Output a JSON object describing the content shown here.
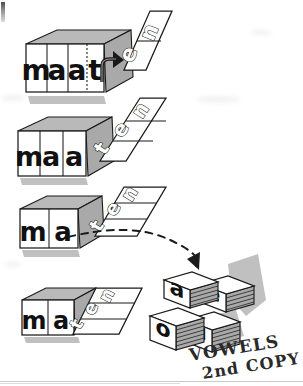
{
  "figure": {
    "background_color": "#ffffff",
    "ink_color": "#1a1a1a",
    "tile_face_color": "#ffffff",
    "tile_shadow_color": "#9b9b9b",
    "tile_side_color": "#a8a8a8",
    "page_rule_color": "#b9b9b9"
  },
  "rows": [
    {
      "id": "row-1",
      "front_word": "maat",
      "front_letters": [
        "m",
        "a",
        "a",
        "t"
      ],
      "folded_letters": [
        "e",
        "n"
      ],
      "folded_word": "en",
      "annotation_icon": "rotation-arrow-icon",
      "note": "maat with en panel swung open"
    },
    {
      "id": "row-2",
      "front_word": "maa",
      "front_letters": [
        "m",
        "a",
        "a"
      ],
      "folded_letters": [
        "t",
        "e",
        "n"
      ],
      "folded_word": "ten",
      "annotation_icon": "none",
      "note": "maa with ten panel angled"
    },
    {
      "id": "row-3",
      "front_word": "ma",
      "front_letters": [
        "m",
        "a"
      ],
      "folded_letters": [
        "t",
        "e",
        "n"
      ],
      "folded_word": "ten",
      "annotation_icon": "dashed-curved-arrow-icon",
      "note": "ma with ten panel, dashed arrow to vowel stacks"
    },
    {
      "id": "row-4",
      "front_word": "ma",
      "front_letters": [
        "m",
        "a"
      ],
      "folded_letters": [
        "t",
        "e",
        "n"
      ],
      "folded_word": "ten",
      "annotation_icon": "none",
      "note": "maten fully closed"
    }
  ],
  "vowel_stacks": {
    "label_line_1": "VOWELS",
    "label_line_2": "2nd COPY",
    "cards": [
      {
        "letter": "a",
        "position": "back-left"
      },
      {
        "letter": "e",
        "position": "back-right"
      },
      {
        "letter": "o",
        "position": "front-left"
      },
      {
        "letter": "u",
        "position": "front-right"
      }
    ]
  },
  "arrows": {
    "rotation_label": "rotate panel",
    "transfer_label": "draw a vowel card"
  }
}
